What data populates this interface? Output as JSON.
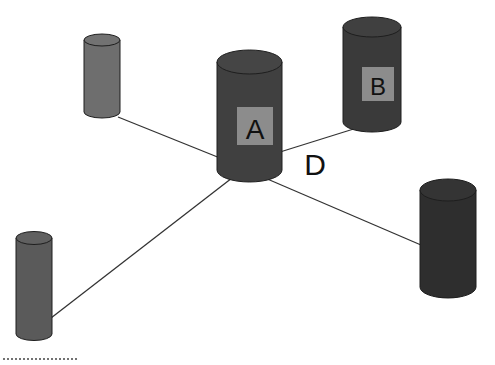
{
  "diagram": {
    "nodes": [
      {
        "id": "A",
        "label": "A",
        "fill": "#404040"
      },
      {
        "id": "B",
        "label": "B",
        "fill": "#3a3a3a"
      },
      {
        "id": "top-left",
        "label": "",
        "fill": "#6e6e6e"
      },
      {
        "id": "bottom-left",
        "label": "",
        "fill": "#5a5a5a"
      },
      {
        "id": "right",
        "label": "",
        "fill": "#2e2e2e"
      }
    ],
    "edge_label": "D",
    "colors": {
      "label_box": "#8c8c8c",
      "edge": "#333333",
      "outline": "#1e1e1e"
    }
  }
}
